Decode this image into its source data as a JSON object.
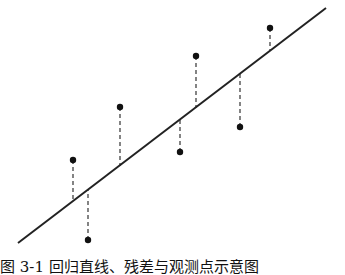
{
  "diagram": {
    "type": "linear-regression-residuals",
    "regression_line": {
      "x1": 18,
      "y1": 243,
      "x2": 326,
      "y2": 8,
      "color": "#222222"
    },
    "points": [
      {
        "x": 73,
        "y": 160,
        "line_y": 201
      },
      {
        "x": 88,
        "y": 240,
        "line_y": 190
      },
      {
        "x": 120,
        "y": 107,
        "line_y": 166
      },
      {
        "x": 180,
        "y": 152,
        "line_y": 120
      },
      {
        "x": 196,
        "y": 56,
        "line_y": 108
      },
      {
        "x": 240,
        "y": 127,
        "line_y": 74
      },
      {
        "x": 270,
        "y": 28,
        "line_y": 50
      }
    ],
    "point_color": "#111111",
    "residual_style": "dashed"
  },
  "caption": {
    "text": "图 3-1  回归直线、残差与观测点示意图"
  }
}
